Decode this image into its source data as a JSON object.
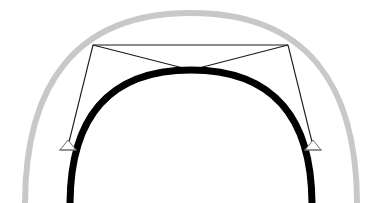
{
  "figure": {
    "background_color": "#ffffff",
    "width": 382,
    "height": 203
  },
  "chart_data": {
    "type": "diagram",
    "xlabel": "",
    "ylabel": "",
    "xlim": [
      0,
      382
    ],
    "ylim": [
      0,
      203
    ],
    "grid": false,
    "legend": "none",
    "annotations": [],
    "series": [
      {
        "name": "outer-arch",
        "role": "outer reference arch",
        "color": "#c8c8c8",
        "stroke_width": 6,
        "shape": "semi-elliptical arc",
        "left_springing": [
          25,
          203
        ],
        "right_springing": [
          357,
          203
        ],
        "apex": [
          191,
          13
        ],
        "span": 332,
        "rise": 190
      },
      {
        "name": "inner-arch",
        "role": "primary bold arch rib",
        "color": "#000000",
        "stroke_width": 7,
        "shape": "semi-elliptical arc",
        "left_springing": [
          70,
          203
        ],
        "right_springing": [
          312,
          203
        ],
        "apex": [
          191,
          70
        ],
        "span": 242,
        "rise": 133
      },
      {
        "name": "cable-network",
        "role": "thin line cross-braced hangers and struts",
        "color": "#1a1a1a",
        "stroke_width": 1,
        "nodes": {
          "top_left": [
            93,
            45
          ],
          "top_right": [
            288,
            45
          ],
          "crossing_apex": [
            191,
            70
          ],
          "anchor_left": [
            68,
            146
          ],
          "anchor_right": [
            313,
            146
          ]
        },
        "segments": [
          {
            "name": "left-top-chord",
            "from": [
              93,
              45
            ],
            "to": [
              288,
              45
            ]
          },
          {
            "name": "left-diagonal-to-apex",
            "from": [
              93,
              45
            ],
            "to": [
              191,
              70
            ]
          },
          {
            "name": "right-diagonal-to-apex",
            "from": [
              288,
              45
            ],
            "to": [
              191,
              70
            ]
          },
          {
            "name": "left-hanger",
            "from": [
              93,
              45
            ],
            "to": [
              68,
              146
            ]
          },
          {
            "name": "right-hanger",
            "from": [
              288,
              45
            ],
            "to": [
              313,
              146
            ]
          }
        ]
      }
    ],
    "markers": [
      {
        "name": "anchor-left",
        "position": [
          68,
          146
        ],
        "glyph": "triangle-support",
        "color": "#6e6e6e",
        "fill": "#ffffff"
      },
      {
        "name": "anchor-right",
        "position": [
          313,
          146
        ],
        "glyph": "triangle-support",
        "color": "#6e6e6e",
        "fill": "#ffffff"
      }
    ],
    "colors": {
      "outer_arch": "#c8c8c8",
      "inner_arch": "#000000",
      "cable": "#1a1a1a",
      "anchor": "#6e6e6e",
      "background": "#ffffff"
    }
  }
}
